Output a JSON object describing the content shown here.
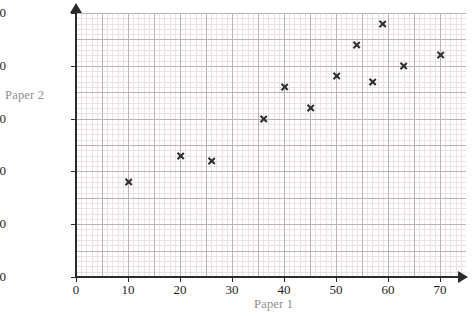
{
  "chart_data": {
    "type": "scatter",
    "title": "",
    "xlabel": "Paper 1",
    "ylabel": "Paper 2",
    "xlim": [
      0,
      75
    ],
    "ylim": [
      0,
      50
    ],
    "xticks": [
      0,
      10,
      20,
      30,
      40,
      50,
      60,
      70
    ],
    "yticks": [
      0,
      10,
      20,
      30,
      40,
      50
    ],
    "grid": true,
    "grid_major_step": 5,
    "grid_minor_step": 1,
    "legend": "none",
    "marker": "x",
    "marker_color": "#2e2e2e",
    "points": [
      {
        "x": 10,
        "y": 18
      },
      {
        "x": 20,
        "y": 23
      },
      {
        "x": 26,
        "y": 22
      },
      {
        "x": 36,
        "y": 30
      },
      {
        "x": 40,
        "y": 36
      },
      {
        "x": 45,
        "y": 32
      },
      {
        "x": 50,
        "y": 38
      },
      {
        "x": 54,
        "y": 44
      },
      {
        "x": 57,
        "y": 37
      },
      {
        "x": 59,
        "y": 48
      },
      {
        "x": 63,
        "y": 40
      },
      {
        "x": 70,
        "y": 42
      }
    ]
  }
}
